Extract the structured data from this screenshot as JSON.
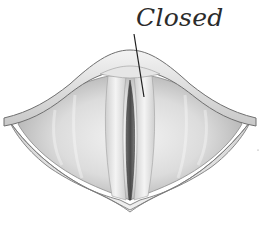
{
  "diagram": {
    "state_label": "Closed",
    "colors": {
      "background": "#ffffff",
      "outline": "#6f6f6f",
      "rim_light": "#efefef",
      "rim_shade": "#bdbdbd",
      "cavity_light": "#e4e4e4",
      "cavity_shade": "#a8a8a8",
      "fold_light": "#f2f2f2",
      "glottis_slit": "#555555",
      "leader_line": "#1f1f1f",
      "label_text": "#2b2b2b"
    }
  }
}
